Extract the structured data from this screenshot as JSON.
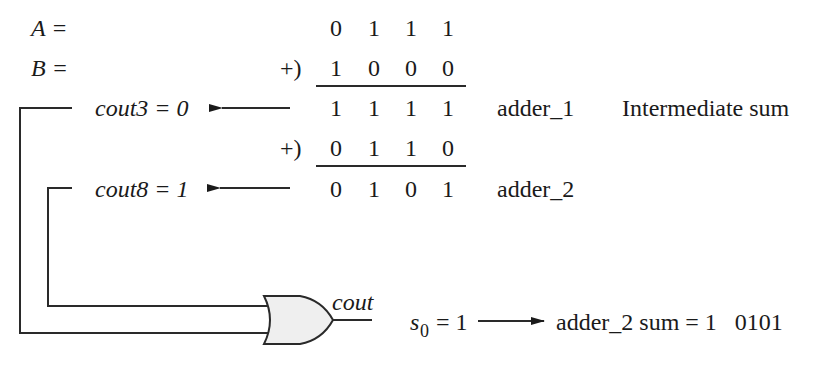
{
  "rows": {
    "a": {
      "label": "A =",
      "digits": [
        "0",
        "1",
        "1",
        "1"
      ]
    },
    "b": {
      "label": "B =",
      "op": "+)",
      "digits": [
        "1",
        "0",
        "0",
        "0"
      ]
    },
    "sum1": {
      "carry_label": "cout3 = 0",
      "digits": [
        "1",
        "1",
        "1",
        "1"
      ],
      "adder": "adder_1",
      "note": "Intermediate sum"
    },
    "corr": {
      "op": "+)",
      "digits": [
        "0",
        "1",
        "1",
        "0"
      ]
    },
    "sum2": {
      "carry_label": "cout8 = 1",
      "digits": [
        "0",
        "1",
        "0",
        "1"
      ],
      "adder": "adder_2"
    }
  },
  "gate": {
    "type": "OR",
    "output_label": "cout",
    "fill": "#efefef",
    "s0_label": "s",
    "s0_sub": "0",
    "s0_value": " = 1",
    "result": "adder_2 sum = 1   0101"
  },
  "colors": {
    "ink": "#1a1a1a",
    "gate_fill": "#efefef"
  }
}
